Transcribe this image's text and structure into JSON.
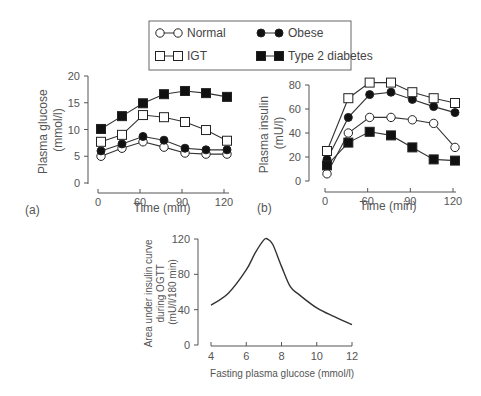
{
  "legend": {
    "items": [
      {
        "label": "Normal",
        "marker": "open-circle"
      },
      {
        "label": "Obese",
        "marker": "filled-circle"
      },
      {
        "label": "IGT",
        "marker": "open-square"
      },
      {
        "label": "Type 2 diabetes",
        "marker": "filled-square"
      }
    ]
  },
  "panel_a": {
    "label": "(a)"
  },
  "panel_b": {
    "label": "(b)"
  },
  "chart_data": [
    {
      "id": "a",
      "type": "line",
      "panel_label": "(a)",
      "title": "",
      "xlabel": "Time (min)",
      "ylabel": "Plasma glucose (mmol/l)",
      "ylabel_lines": [
        "Plasma glucose",
        "(mmol/l)"
      ],
      "x_ticks": [
        "0",
        "60",
        "90",
        "120"
      ],
      "y_ticks": [
        "0",
        "5",
        "10",
        "15",
        "20"
      ],
      "ylim": [
        0,
        20
      ],
      "grid": false,
      "x": [
        0,
        45,
        60,
        75,
        90,
        105,
        120
      ],
      "x_note": "Estimated sample times. Markers are evenly spaced and the printed tick labels (0, 60, 90, 120) sit on evenly spaced ticks, which is not a linear scale; exact times are not recoverable from the figure.",
      "series": [
        {
          "name": "Normal",
          "marker": "open-circle",
          "values": [
            5.0,
            6.5,
            7.7,
            6.7,
            5.6,
            5.4,
            5.4
          ]
        },
        {
          "name": "Obese",
          "marker": "filled-circle",
          "values": [
            6.0,
            7.3,
            8.7,
            8.0,
            6.5,
            6.2,
            6.2
          ]
        },
        {
          "name": "IGT",
          "marker": "open-square",
          "values": [
            7.7,
            9.0,
            12.7,
            12.3,
            11.4,
            9.9,
            7.9
          ]
        },
        {
          "name": "Type 2 diabetes",
          "marker": "filled-square",
          "values": [
            10.1,
            12.5,
            14.9,
            16.6,
            17.2,
            16.8,
            16.1
          ]
        }
      ]
    },
    {
      "id": "b",
      "type": "line",
      "panel_label": "(b)",
      "title": "",
      "xlabel": "Time (min)",
      "ylabel": "Plasma insulin (mU/l)",
      "ylabel_lines": [
        "Plasma insulin",
        "(mU/l)"
      ],
      "x_ticks": [
        "0",
        "60",
        "90",
        "120"
      ],
      "y_ticks": [
        "0",
        "20",
        "40",
        "60",
        "80"
      ],
      "ylim": [
        0,
        80
      ],
      "grid": false,
      "x": [
        0,
        45,
        60,
        75,
        90,
        105,
        120
      ],
      "x_note": "Estimated sample times; same axis labelling issue as panel (a).",
      "series": [
        {
          "name": "Normal",
          "marker": "open-circle",
          "values": [
            6,
            40,
            53,
            53,
            51,
            48,
            28
          ]
        },
        {
          "name": "Obese",
          "marker": "filled-circle",
          "values": [
            18,
            53,
            72,
            74,
            68,
            62,
            57
          ]
        },
        {
          "name": "IGT",
          "marker": "open-square",
          "values": [
            25,
            69,
            82,
            82,
            74,
            69,
            65
          ]
        },
        {
          "name": "Type 2 diabetes",
          "marker": "filled-square",
          "values": [
            13,
            32,
            41,
            38,
            28,
            18,
            17
          ]
        }
      ]
    },
    {
      "id": "c",
      "type": "line",
      "title": "",
      "xlabel": "Fasting plasma glucose (mmol/l)",
      "ylabel": "Area under insulin curve during OGTT (mU/l/180 min)",
      "ylabel_lines": [
        "Area under insulin curve",
        "during OGTT",
        "(mU/l/180 min)"
      ],
      "x_ticks": [
        "4",
        "6",
        "8",
        "10",
        "12"
      ],
      "y_ticks": [
        "0",
        "40",
        "80",
        "120"
      ],
      "xlim": [
        4,
        12
      ],
      "ylim": [
        0,
        120
      ],
      "grid": false,
      "x": [
        4.0,
        5.0,
        6.0,
        6.5,
        7.0,
        7.2,
        7.5,
        8.0,
        8.5,
        9.0,
        10.0,
        11.0,
        12.0
      ],
      "values": [
        45,
        59,
        85,
        104,
        119,
        120,
        114,
        89,
        66,
        57,
        42,
        32,
        23
      ]
    }
  ]
}
